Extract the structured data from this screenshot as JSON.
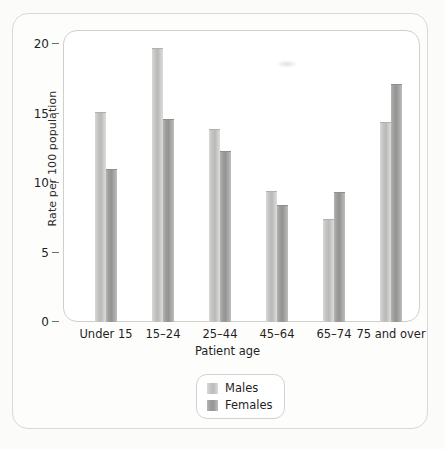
{
  "chart_data": {
    "type": "bar",
    "title": "",
    "xlabel": "Patient age",
    "ylabel": "Rate per 100 population",
    "categories": [
      "Under 15",
      "15–24",
      "25–44",
      "45–64",
      "65–74",
      "75 and over"
    ],
    "series": [
      {
        "name": "Males",
        "values": [
          15.1,
          19.7,
          13.9,
          9.4,
          7.4,
          14.4
        ]
      },
      {
        "name": "Females",
        "values": [
          11.0,
          14.6,
          12.3,
          8.4,
          9.3,
          17.1
        ]
      }
    ],
    "ylim": [
      0,
      20
    ],
    "yticks": [
      0,
      5,
      10,
      15,
      20
    ],
    "ytick_labels": [
      "0",
      "5",
      "10",
      "15",
      "20"
    ],
    "grid": false,
    "legend_position": "bottom-center",
    "colors": {
      "males": "#c4c4c2",
      "females": "#9e9e9c",
      "panel_border": "#cfcfcc",
      "frame_border": "#d9d9d6",
      "background": "#fbfbfa",
      "text": "#1f1f1f"
    }
  },
  "legend": {
    "entries": [
      {
        "label": "Males"
      },
      {
        "label": "Females"
      }
    ]
  }
}
